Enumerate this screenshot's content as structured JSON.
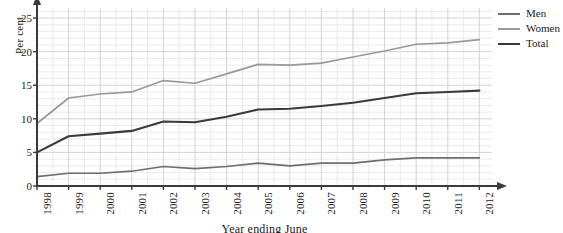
{
  "chart_data": {
    "type": "line",
    "title": "",
    "subtitle": "",
    "xlabel": "Year ending June",
    "ylabel": "Per cent",
    "categories": [
      1998,
      1999,
      2000,
      2001,
      2002,
      2003,
      2004,
      2005,
      2006,
      2007,
      2008,
      2009,
      2010,
      2011,
      2012
    ],
    "xtick_labels": [
      "1998",
      "1999",
      "2000",
      "2001",
      "2002",
      "2003",
      "2004",
      "2005",
      "2006",
      "2007",
      "2008",
      "2009",
      "2010",
      "2011",
      "2012"
    ],
    "ytick_labels": [
      "0",
      "5",
      "10",
      "15",
      "20",
      "25"
    ],
    "ytick_values": [
      0,
      5,
      10,
      15,
      20,
      25
    ],
    "xlim": [
      1998,
      2012.4
    ],
    "ylim": [
      0,
      26.5
    ],
    "grid": true,
    "grid_minor": true,
    "grid_minor_per_interval": 2,
    "legend_position": "outside-top-right",
    "series": [
      {
        "name": "Men",
        "color": "#6e6e6e",
        "values": [
          1.4,
          1.9,
          1.9,
          2.2,
          2.9,
          2.6,
          2.9,
          3.4,
          3.0,
          3.4,
          3.4,
          3.9,
          4.2,
          4.2,
          4.2
        ]
      },
      {
        "name": "Women",
        "color": "#999999",
        "values": [
          9.3,
          13.1,
          13.7,
          14.0,
          15.7,
          15.3,
          16.7,
          18.1,
          18.0,
          18.3,
          19.2,
          20.1,
          21.1,
          21.3,
          21.8
        ]
      },
      {
        "name": "Total",
        "color": "#3a3a3a",
        "values": [
          5.0,
          7.4,
          7.8,
          8.2,
          9.6,
          9.5,
          10.3,
          11.4,
          11.5,
          11.9,
          12.4,
          13.1,
          13.8,
          14.0,
          14.2
        ]
      }
    ]
  },
  "legend": {
    "items": [
      {
        "label": "Men",
        "color": "#6e6e6e"
      },
      {
        "label": "Women",
        "color": "#999999"
      },
      {
        "label": "Total",
        "color": "#3a3a3a"
      }
    ]
  },
  "axes": {
    "y_title": "Per cent",
    "x_title": "Year ending June",
    "grid_color": "#cfcfcf",
    "grid_minor_color": "#e2e2e2",
    "axis_color": "#3a3a3a"
  }
}
